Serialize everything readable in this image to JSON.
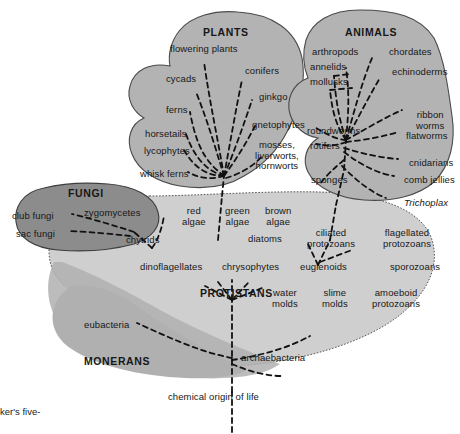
{
  "figure": {
    "title_caption": "ker's five-",
    "root_label": "chemical origin of life",
    "colors": {
      "fungi_fill": "#8c8c8c",
      "plants_fill": "#b3b3b3",
      "animals_fill": "#b3b3b3",
      "monerans_fill": "#b0b0b0",
      "protistans_fill": "#cfcfcf",
      "outline": "#3d3d3d",
      "branch": "#111111",
      "background": "#ffffff"
    }
  },
  "kingdoms": [
    {
      "name": "PLANTS",
      "x": 203,
      "y": 27,
      "fill": "#b3b3b3"
    },
    {
      "name": "ANIMALS",
      "x": 345,
      "y": 27,
      "fill": "#b3b3b3"
    },
    {
      "name": "FUNGI",
      "x": 68,
      "y": 188,
      "fill": "#8c8c8c"
    },
    {
      "name": "PROTISTANS",
      "x": 200,
      "y": 288,
      "fill": "#cfcfcf"
    },
    {
      "name": "MONERANS",
      "x": 84,
      "y": 356,
      "fill": "#b0b0b0"
    }
  ],
  "taxa": {
    "plants": [
      {
        "label": "flowering plants",
        "x": 170,
        "y": 44
      },
      {
        "label": "cycads",
        "x": 166,
        "y": 74
      },
      {
        "label": "conifers",
        "x": 245,
        "y": 66
      },
      {
        "label": "ginkgo",
        "x": 259,
        "y": 92
      },
      {
        "label": "ferns",
        "x": 166,
        "y": 105
      },
      {
        "label": "gnetophytes",
        "x": 252,
        "y": 120
      },
      {
        "label": "horsetails",
        "x": 145,
        "y": 129
      },
      {
        "label": "lycophytes",
        "x": 144,
        "y": 146
      },
      {
        "label": "mosses,\nliverworts,\nhornworts",
        "x": 255,
        "y": 140
      },
      {
        "label": "whisk ferns",
        "x": 140,
        "y": 169
      }
    ],
    "animals": [
      {
        "label": "arthropods",
        "x": 312,
        "y": 47
      },
      {
        "label": "chordates",
        "x": 389,
        "y": 47
      },
      {
        "label": "annelids",
        "x": 310,
        "y": 62
      },
      {
        "label": "echinoderms",
        "x": 392,
        "y": 67
      },
      {
        "label": "mollusks",
        "x": 310,
        "y": 77
      },
      {
        "label": "ribbon\nworms",
        "x": 416,
        "y": 110
      },
      {
        "label": "roundworms",
        "x": 307,
        "y": 126
      },
      {
        "label": "flatworms",
        "x": 406,
        "y": 131
      },
      {
        "label": "rotifers",
        "x": 310,
        "y": 141
      },
      {
        "label": "cnidarians",
        "x": 409,
        "y": 158
      },
      {
        "label": "sponges",
        "x": 311,
        "y": 175
      },
      {
        "label": "comb jellies",
        "x": 404,
        "y": 175
      },
      {
        "label": "Trichoplax",
        "x": 404,
        "y": 198,
        "italic": true
      }
    ],
    "fungi": [
      {
        "label": "club fungi",
        "x": 12,
        "y": 211
      },
      {
        "label": "zygomycetes",
        "x": 84,
        "y": 208
      },
      {
        "label": "sac fungi",
        "x": 16,
        "y": 229
      },
      {
        "label": "chytrids",
        "x": 126,
        "y": 235
      }
    ],
    "protistans": [
      {
        "label": "red\nalgae",
        "x": 182,
        "y": 206
      },
      {
        "label": "green\nalgae",
        "x": 225,
        "y": 206
      },
      {
        "label": "brown\nalgae",
        "x": 265,
        "y": 206
      },
      {
        "label": "diatoms",
        "x": 248,
        "y": 234
      },
      {
        "label": "ciliated\nprotozoans",
        "x": 307,
        "y": 228
      },
      {
        "label": "flagellated\nprotozoans",
        "x": 383,
        "y": 228
      },
      {
        "label": "dinoflagellates",
        "x": 140,
        "y": 262
      },
      {
        "label": "chrysophytes",
        "x": 222,
        "y": 262
      },
      {
        "label": "euglenoids",
        "x": 300,
        "y": 262
      },
      {
        "label": "sporozoans",
        "x": 390,
        "y": 262
      },
      {
        "label": "water\nmolds",
        "x": 272,
        "y": 288
      },
      {
        "label": "slime\nmolds",
        "x": 322,
        "y": 288
      },
      {
        "label": "amoeboid\nprotozoans",
        "x": 372,
        "y": 288
      }
    ],
    "monerans": [
      {
        "label": "eubacteria",
        "x": 84,
        "y": 320
      },
      {
        "label": "archaebacteria",
        "x": 241,
        "y": 353
      }
    ]
  }
}
